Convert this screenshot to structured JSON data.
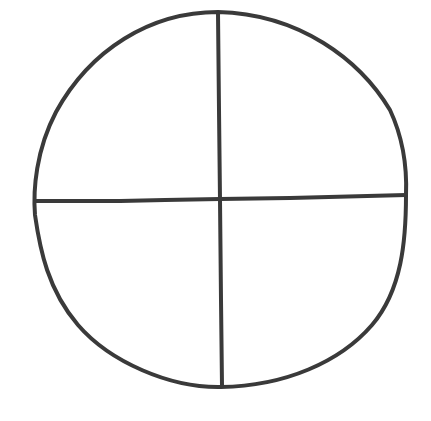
{
  "diagram": {
    "background": "#ffffff",
    "stroke_color": "#3a3a3a",
    "stroke_width": 4,
    "circle": {
      "top": [
        218,
        12
      ],
      "right": [
        406,
        195
      ],
      "bottom": [
        221,
        387
      ],
      "left": [
        34,
        200
      ]
    },
    "lines": [
      {
        "name": "vertical-divider",
        "from": [
          218,
          12
        ],
        "to": [
          222,
          387
        ]
      },
      {
        "name": "horizontal-divider",
        "from": [
          34,
          201
        ],
        "to": [
          406,
          195
        ]
      }
    ],
    "quadrants": [
      "top-left",
      "top-right",
      "bottom-left",
      "bottom-right"
    ]
  }
}
